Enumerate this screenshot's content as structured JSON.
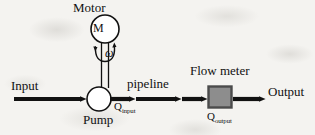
{
  "diagram": {
    "background_color": "#f4f3f0",
    "stroke_color": "#111111",
    "labels": {
      "motor": "Motor",
      "motor_symbol": "M",
      "omega": "ω",
      "input": "Input",
      "pump": "Pump",
      "pipeline": "pipeline",
      "flow_meter": "Flow meter",
      "output": "Output",
      "q_input_base": "Q",
      "q_input_sub": "input",
      "q_output_base": "Q",
      "q_output_sub": "output"
    },
    "components": [
      {
        "name": "motor",
        "shape": "circle",
        "label": "Motor",
        "symbol": "M",
        "cx": 105,
        "cy": 29,
        "r": 14,
        "fill": "#ffffff",
        "stroke": "#111111"
      },
      {
        "name": "shaft",
        "shape": "double-line",
        "from": [
          105,
          43
        ],
        "to": [
          105,
          88
        ],
        "stroke": "#111111"
      },
      {
        "name": "rotation-arrow",
        "shape": "arc-double-headed",
        "label": "ω",
        "stroke": "#111111"
      },
      {
        "name": "pump",
        "shape": "circle",
        "label": "Pump",
        "cx": 99,
        "cy": 99,
        "r": 12,
        "fill": "#ffffff",
        "stroke": "#111111"
      },
      {
        "name": "flow-meter",
        "shape": "rectangle",
        "label": "Flow meter",
        "x": 208,
        "y": 86,
        "width": 24,
        "height": 22,
        "fill": "#8d8d8d",
        "stroke": "#4b4b4b"
      }
    ],
    "flow_arrows": [
      {
        "name": "input-arrow",
        "from": [
          14,
          99
        ],
        "to": [
          86,
          99
        ],
        "label": "Input"
      },
      {
        "name": "pump-to-pipeline-arrow",
        "from": [
          111,
          99
        ],
        "to": [
          135,
          99
        ],
        "label": "Q input"
      },
      {
        "name": "pipeline-arrow",
        "from": [
          135,
          99
        ],
        "to": [
          207,
          99
        ],
        "label": "pipeline"
      },
      {
        "name": "meter-to-output-arrow",
        "from": [
          232,
          99
        ],
        "to": [
          265,
          99
        ],
        "label": "Output"
      }
    ],
    "colors": {
      "line": "#111111",
      "meter_fill": "#8d8d8d",
      "meter_border": "#4b4b4b",
      "paper": "#f4f3f0"
    }
  }
}
